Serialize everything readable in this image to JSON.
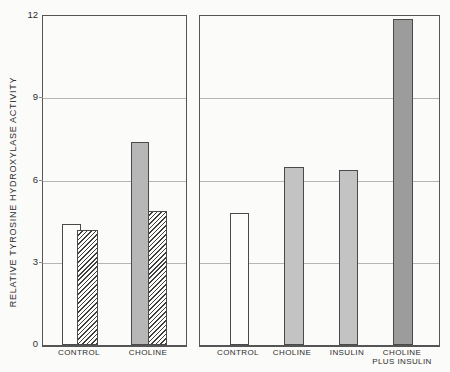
{
  "chart_data": {
    "type": "bar",
    "title": "",
    "ylabel": "RELATIVE TYROSINE HYDROXYLASE ACTIVITY",
    "xlabel": "",
    "ylim": [
      0,
      12
    ],
    "yticks": [
      0,
      3,
      6,
      9,
      12
    ],
    "gridlines": [
      3,
      6,
      9
    ],
    "grid": "on",
    "legend": "none",
    "panels": [
      {
        "name": "left",
        "groups": [
          {
            "label_lines": [
              "CONTROL"
            ],
            "bars": [
              {
                "name": "left-control-open",
                "value": 4.4,
                "fill": "open",
                "pattern": "solid"
              },
              {
                "name": "left-control-hatched",
                "value": 4.2,
                "fill": "open",
                "pattern": "hatch"
              }
            ]
          },
          {
            "label_lines": [
              "CHOLINE"
            ],
            "bars": [
              {
                "name": "left-choline-gray",
                "value": 7.4,
                "fill": "gray",
                "pattern": "solid"
              },
              {
                "name": "left-choline-hatched",
                "value": 4.9,
                "fill": "open",
                "pattern": "hatch"
              }
            ]
          }
        ]
      },
      {
        "name": "right",
        "groups": [
          {
            "label_lines": [
              "CONTROL"
            ],
            "bars": [
              {
                "name": "right-control-open",
                "value": 4.8,
                "fill": "open",
                "pattern": "solid"
              }
            ]
          },
          {
            "label_lines": [
              "CHOLINE"
            ],
            "bars": [
              {
                "name": "right-choline",
                "value": 6.5,
                "fill": "lightgray",
                "pattern": "solid"
              }
            ]
          },
          {
            "label_lines": [
              "INSULIN"
            ],
            "bars": [
              {
                "name": "right-insulin",
                "value": 6.4,
                "fill": "lightgray",
                "pattern": "solid"
              }
            ]
          },
          {
            "label_lines": [
              "CHOLINE",
              "PLUS INSULIN"
            ],
            "bars": [
              {
                "name": "right-choline-plus-insulin",
                "value": 11.9,
                "fill": "darkgray",
                "pattern": "solid"
              }
            ]
          }
        ]
      }
    ],
    "colors": {
      "paper": "#fbfbf9",
      "frame": "#555555",
      "grid": "#b5b5b5",
      "bar_border": "#4a4a4a",
      "open_fill": "#fdfdfc",
      "gray_fill": "#b7b7b7",
      "lightgray_fill": "#c3c3c3",
      "darkgray_fill": "#9c9c9c",
      "hatch_line": "#3e3e3e",
      "text": "#2e2e2e"
    }
  }
}
